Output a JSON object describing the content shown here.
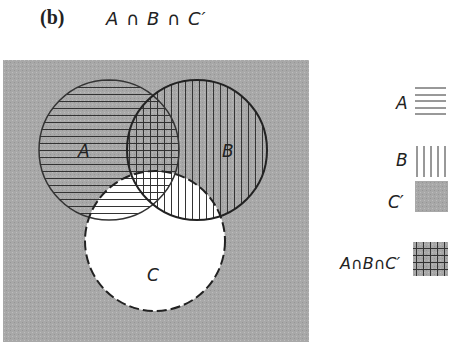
{
  "panel_label": "(b)",
  "title": "A ∩ B ∩ C′",
  "colors": {
    "background": "#a8a8a8",
    "circle_stroke": "#333333",
    "c_fill": "#ffffff",
    "hatch": "#333333"
  },
  "diagram": {
    "sets": [
      {
        "name": "A",
        "label": "A",
        "pattern": "horizontal-lines",
        "outline": "solid"
      },
      {
        "name": "B",
        "label": "B",
        "pattern": "vertical-lines",
        "outline": "solid"
      },
      {
        "name": "C",
        "label": "C",
        "pattern": "none",
        "outline": "dashed"
      }
    ],
    "shaded_region": "A ∩ B ∩ C′"
  },
  "legend": [
    {
      "label": "A",
      "swatch": "horizontal-lines"
    },
    {
      "label": "B",
      "swatch": "vertical-lines"
    },
    {
      "label": "C′",
      "swatch": "gray"
    },
    {
      "label": "A∩B∩C′",
      "swatch": "crosshatch-gray"
    }
  ]
}
